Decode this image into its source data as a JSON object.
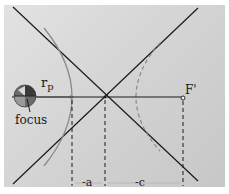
{
  "diagram": {
    "type": "hyperbolic-orbit-geometry",
    "labels": {
      "periapsis_distance": "r",
      "periapsis_subscript": "p",
      "focus": "focus",
      "second_focus": "F'",
      "semi_major": "-a",
      "focal_distance": "-c"
    },
    "elements": [
      {
        "id": "asymptote-1",
        "kind": "solid-line"
      },
      {
        "id": "asymptote-2",
        "kind": "solid-line"
      },
      {
        "id": "major-axis",
        "kind": "solid-line"
      },
      {
        "id": "occupied-branch",
        "kind": "solid-curve"
      },
      {
        "id": "vacant-branch",
        "kind": "dashed-curve"
      },
      {
        "id": "planet-at-focus",
        "kind": "sphere"
      },
      {
        "id": "second-focus-marker",
        "kind": "open-circle"
      },
      {
        "id": "dimension-lines",
        "kind": "dashed-verticals"
      }
    ],
    "colors": {
      "background_light": "#e2e2e2",
      "background_dark": "#c7c7c7",
      "line": "#1a1a1a",
      "curve": "#8a8a8a",
      "planet_dark": "#555555",
      "planet_light": "#9a9a9a"
    }
  }
}
